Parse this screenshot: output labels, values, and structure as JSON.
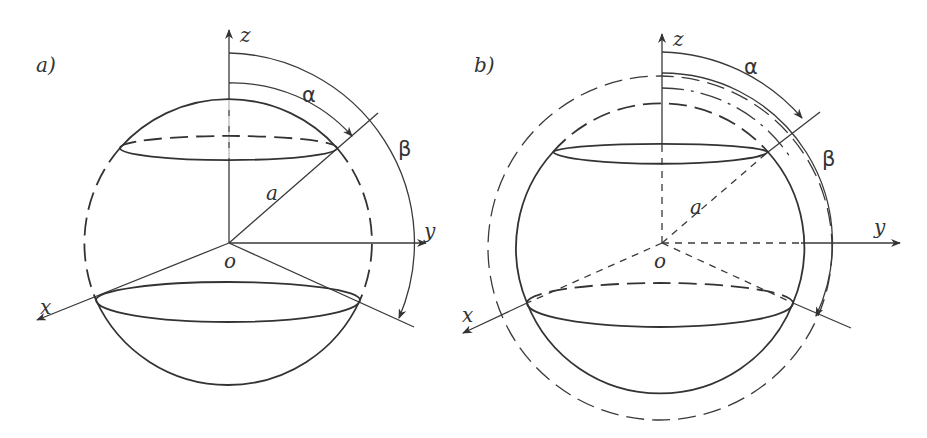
{
  "figure": {
    "panel_a": {
      "label": "a)",
      "axes": {
        "x": "x",
        "y": "y",
        "z": "z",
        "origin": "o"
      },
      "radius_label": "a",
      "angles": {
        "alpha": "α",
        "beta": "β"
      }
    },
    "panel_b": {
      "label": "b)",
      "axes": {
        "x": "x",
        "y": "y",
        "z": "z",
        "origin": "o"
      },
      "radius_label": "a",
      "angles": {
        "alpha": "α",
        "beta": "β"
      }
    }
  }
}
